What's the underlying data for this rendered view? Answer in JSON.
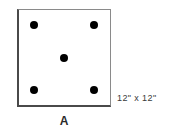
{
  "figure": {
    "label": "A",
    "dimension_text": "12\" x 12\"",
    "tile": {
      "shape": "square",
      "stroke_color": "#4a4a4a",
      "fill_color": "#ffffff",
      "dot_color": "#000000",
      "dot_count": 5,
      "pattern_name": "dice-five"
    },
    "dots": [
      {
        "name": "dot-top-left",
        "x_pct": 17,
        "y_pct": 16
      },
      {
        "name": "dot-top-right",
        "x_pct": 82,
        "y_pct": 16
      },
      {
        "name": "dot-center",
        "x_pct": 49,
        "y_pct": 50
      },
      {
        "name": "dot-bottom-left",
        "x_pct": 17,
        "y_pct": 84
      },
      {
        "name": "dot-bottom-right",
        "x_pct": 82,
        "y_pct": 84
      }
    ]
  }
}
